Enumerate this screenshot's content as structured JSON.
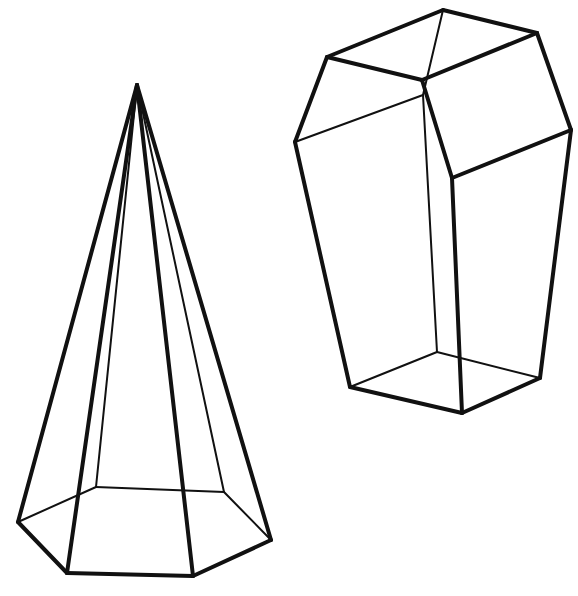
{
  "figure": {
    "stroke_color": "#111111",
    "background": "#ffffff"
  },
  "solids": [
    {
      "name": "hexagonal-pyramid",
      "apex": [
        137,
        85
      ],
      "base": [
        [
          18,
          522
        ],
        [
          67,
          573
        ],
        [
          193,
          576
        ],
        [
          271,
          540
        ],
        [
          224,
          492
        ],
        [
          96,
          487
        ]
      ]
    },
    {
      "name": "truncated-prism",
      "top": [
        [
          443,
          10
        ],
        [
          537,
          33
        ],
        [
          422,
          80
        ],
        [
          327,
          57
        ]
      ],
      "middle": [
        [
          295,
          142
        ],
        [
          423,
          95
        ],
        [
          452,
          178
        ],
        [
          571,
          130
        ]
      ],
      "bottom": [
        [
          350,
          387
        ],
        [
          437,
          352
        ],
        [
          540,
          378
        ],
        [
          462,
          413
        ]
      ]
    }
  ]
}
